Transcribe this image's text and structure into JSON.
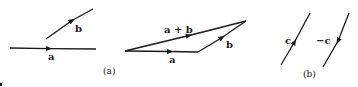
{
  "figure": {
    "panel_a": {
      "caption": "(a)",
      "separate_vectors": {
        "a_label": "a",
        "b_label": "b"
      },
      "triangle": {
        "a_label": "a",
        "b_label": "b",
        "sum_label": "a + b"
      }
    },
    "panel_b": {
      "caption": "(b)",
      "c_label": "c",
      "neg_c_label": "−c"
    },
    "colors": {
      "stroke": "#1a1a1a",
      "background": "#ffffff"
    }
  }
}
